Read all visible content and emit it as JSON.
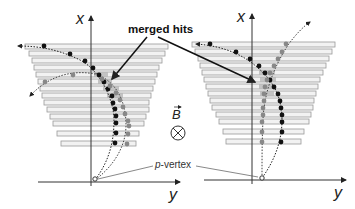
{
  "labels": {
    "merged_hits": "merged hits",
    "p_vertex": "p-vertex",
    "p_vertex_italic": "p",
    "p_vertex_rest": "-vertex",
    "b_field": "B",
    "b_field_symbol": "⊗"
  },
  "panels": [
    {
      "id": "left",
      "x_axis_label": "x",
      "y_axis_label": "y",
      "description": "two tracks crossing; merged hits where they overlap"
    },
    {
      "id": "right",
      "x_axis_label": "x",
      "y_axis_label": "y",
      "description": "two tracks forming a V; merged hits near crossing"
    }
  ],
  "colors": {
    "layer_fill": "#f2f2f2",
    "layer_stroke": "#9a9a9a",
    "hit_black": "#111111",
    "hit_gray": "#8a8a8a",
    "merged_shade": "#b5b5b5",
    "axis": "#333333",
    "arrow": "#111111"
  }
}
